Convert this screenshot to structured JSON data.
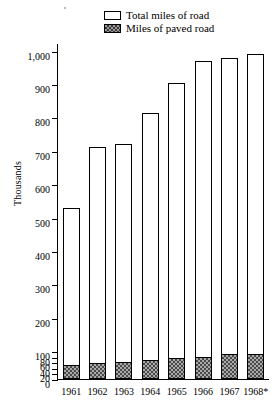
{
  "legend": {
    "items": [
      {
        "label": "Total miles of road",
        "swatch": "open-box",
        "color": "#ffffff"
      },
      {
        "label": "Miles of paved road",
        "swatch": "hatched-box",
        "color": "#4a4a4a"
      }
    ]
  },
  "axis": {
    "ylabel": "Thousands",
    "ytick_labels": [
      "1,000",
      "900",
      "800",
      "700",
      "600",
      "500",
      "400",
      "300",
      "200",
      "100",
      "80",
      "60",
      "40",
      "20",
      "0"
    ]
  },
  "chart_data": {
    "type": "bar",
    "title": "",
    "subtitle": "",
    "xlabel": "",
    "ylabel": "Thousands",
    "categories": [
      "1961",
      "1962",
      "1963",
      "1964",
      "1965",
      "1966",
      "1967",
      "1968*"
    ],
    "series": [
      {
        "name": "Total miles of road",
        "values": [
          530,
          710,
          720,
          812,
          902,
          968,
          978,
          990
        ]
      },
      {
        "name": "Miles of paved road",
        "values": [
          47,
          52,
          57,
          64,
          70,
          76,
          84,
          86
        ]
      }
    ],
    "ylim": [
      0,
      1020
    ],
    "ytick_values": [
      1000,
      900,
      800,
      700,
      600,
      500,
      400,
      300,
      200,
      100,
      80,
      60,
      40,
      20,
      0
    ],
    "axis_note": "broken scale: 0-100 compressed below the 100 tick",
    "grid": false,
    "legend_position": "top-center",
    "annotations": [
      "1968 value marked with asterisk"
    ]
  }
}
